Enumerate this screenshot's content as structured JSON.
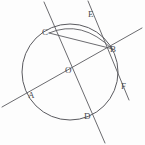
{
  "figure": {
    "kind": "circle-geometry-diagram",
    "width": 145,
    "height": 145,
    "background_color": "#fdfdfd",
    "stroke_color": "#5a5a5f",
    "label_color": "#4a4a50"
  },
  "circle": {
    "name": "main-circle",
    "center_label": "O",
    "center_x": 70,
    "center_y": 72,
    "radius": 48
  },
  "points": [
    {
      "id": "point-c",
      "label": "C",
      "x": 49,
      "y": 33,
      "label_x": 42,
      "label_y": 33
    },
    {
      "id": "point-b",
      "label": "B",
      "x": 112,
      "y": 50,
      "label_x": 110,
      "label_y": 50
    },
    {
      "id": "point-e",
      "label": "E",
      "x": 95,
      "y": 20,
      "label_x": 88,
      "label_y": 15
    },
    {
      "id": "point-f",
      "label": "F",
      "x": 123,
      "y": 93,
      "label_x": 121,
      "label_y": 87
    },
    {
      "id": "point-a",
      "label": "A",
      "x": 31,
      "y": 97,
      "label_x": 28,
      "label_y": 96
    },
    {
      "id": "point-d",
      "label": "D",
      "x": 86,
      "y": 118,
      "label_x": 84,
      "label_y": 117
    },
    {
      "id": "point-o",
      "label": "O",
      "x": 70,
      "y": 72,
      "label_x": 65,
      "label_y": 71
    }
  ],
  "lines": [
    {
      "id": "line-a-b",
      "label": "secant through A, O and B",
      "x1": 2,
      "y1": 107,
      "x2": 142,
      "y2": 28
    },
    {
      "id": "line-c-d",
      "label": "secant through C, O and D",
      "x1": 44,
      "y1": 2,
      "x2": 105,
      "y2": 143
    },
    {
      "id": "line-c-b",
      "label": "chord from C to B",
      "x1": 49,
      "y1": 33,
      "x2": 113,
      "y2": 49
    },
    {
      "id": "line-e-f",
      "label": "tangent through B toward E and F",
      "x1": 88,
      "y1": 1,
      "x2": 129,
      "y2": 100
    }
  ],
  "arcs": [
    {
      "id": "arc-c-to-b",
      "label": "arc from C to B above chord"
    }
  ]
}
